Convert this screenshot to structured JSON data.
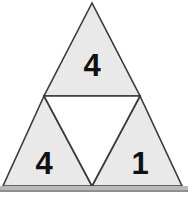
{
  "figure": {
    "name": "subdivided-triangle-diagram",
    "background_color": "#ffffff",
    "canvas": {
      "width": 188,
      "height": 199
    }
  },
  "style": {
    "fill_shaded": "#e9e9e9",
    "fill_unshaded": "#ffffff",
    "stroke_color": "#3a3a3a",
    "stroke_width": 1.6,
    "label_color": "#111111",
    "baseline_band_color": "#b9b9b9",
    "baseline_band_shadow": "#8f8f8f"
  },
  "geometry": {
    "apex": {
      "x": 92,
      "y": 3
    },
    "bottom_left": {
      "x": 3,
      "y": 186
    },
    "bottom_right": {
      "x": 182,
      "y": 186
    },
    "mid_left": {
      "x": 44,
      "y": 96
    },
    "mid_right": {
      "x": 140,
      "y": 96
    },
    "mid_bottom": {
      "x": 92,
      "y": 186
    }
  },
  "triangles": [
    {
      "id": "top",
      "position": "top",
      "shaded": true,
      "label": "4",
      "points": "92,3 44,96 140,96",
      "label_x": 92,
      "label_y": 65
    },
    {
      "id": "bottom-left",
      "position": "bottom-left",
      "shaded": true,
      "label": "4",
      "points": "44,96 3,186 92,186",
      "label_x": 44,
      "label_y": 163
    },
    {
      "id": "bottom-right",
      "position": "bottom-right",
      "shaded": true,
      "label": "1",
      "points": "140,96 92,186 182,186",
      "label_x": 140,
      "label_y": 163
    },
    {
      "id": "center",
      "position": "center-inverted",
      "shaded": false,
      "label": "",
      "points": "44,96 140,96 92,186",
      "label_x": 92,
      "label_y": 140
    }
  ],
  "baseline_band": {
    "x": 0,
    "y": 186,
    "width": 188,
    "height": 5,
    "shadow_y": 190,
    "shadow_height": 2
  }
}
